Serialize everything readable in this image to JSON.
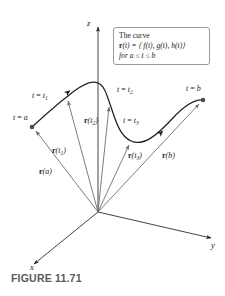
{
  "figure": {
    "caption": "FIGURE 11.71",
    "callout": {
      "line1": "The curve",
      "line2_prefix": "r",
      "line2_rest": "(t) = ⟨ f(t), g(t), h(t)⟩",
      "line3": "for a ≤ t ≤ b"
    },
    "axes": {
      "z_label": "z",
      "y_label": "y",
      "x_label": "x",
      "origin": [
        98,
        212
      ]
    },
    "parameter_labels": [
      {
        "id": "t-equals-a",
        "text_prefix": "t = ",
        "text_var": "a",
        "sub": "",
        "x": 13,
        "y": 114
      },
      {
        "id": "t-equals-t1",
        "text_prefix": "t = ",
        "text_var": "t",
        "sub": "1",
        "x": 32,
        "y": 92
      },
      {
        "id": "t-equals-t2",
        "text_prefix": "t = ",
        "text_var": "t",
        "sub": "2",
        "x": 117,
        "y": 86
      },
      {
        "id": "t-equals-t3",
        "text_prefix": "t = ",
        "text_var": "t",
        "sub": "3",
        "x": 123,
        "y": 117
      },
      {
        "id": "t-equals-b",
        "text_prefix": "t = ",
        "text_var": "b",
        "sub": "",
        "x": 186,
        "y": 85
      }
    ],
    "vector_labels": [
      {
        "id": "vector-label-ra",
        "bold": "r",
        "paren": "(a)",
        "sub": "",
        "x": 39,
        "y": 168
      },
      {
        "id": "vector-label-rt1",
        "bold": "r",
        "paren": "(t",
        "sub": "1",
        "x": 52,
        "y": 147
      },
      {
        "id": "vector-label-rt2",
        "bold": "r",
        "paren": "(t",
        "sub": "2",
        "x": 84,
        "y": 117
      },
      {
        "id": "vector-label-rt3",
        "bold": "r",
        "paren": "(t",
        "sub": "3",
        "x": 128,
        "y": 152
      },
      {
        "id": "vector-label-rb",
        "bold": "r",
        "paren": "(b)",
        "sub": "",
        "x": 162,
        "y": 152
      }
    ],
    "curve_points": {
      "t_a": [
        32,
        127
      ],
      "t_t1": [
        66,
        97
      ],
      "peak": [
        98,
        83
      ],
      "t_t2": [
        110,
        103
      ],
      "t_t3": [
        131,
        141
      ],
      "t_b": [
        203,
        100
      ]
    },
    "colors": {
      "ink": "#231f20",
      "vector_gray": "#6d6e71",
      "curve": "#231f20",
      "callout_border": "#9a9a9a",
      "caption": "#58595b"
    }
  }
}
